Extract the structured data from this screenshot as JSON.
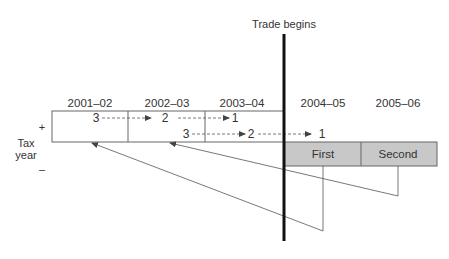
{
  "diagram": {
    "marker_label": "Trade begins",
    "axis_label_line1": "Tax",
    "axis_label_line2": "year",
    "positive_sign": "+",
    "negative_sign": "–",
    "tax_years": [
      "2001–02",
      "2002–03",
      "2003–04",
      "2004–05",
      "2005–06"
    ],
    "loss_boxes": [
      {
        "label": "First",
        "year": "2004–05"
      },
      {
        "label": "Second",
        "year": "2005–06"
      }
    ],
    "carry_back_row1": [
      "3",
      "2",
      "1"
    ],
    "carry_back_row2": [
      "3",
      "2",
      "1"
    ],
    "colors": {
      "loss_fill": "#c8c8c8",
      "line": "#555555",
      "trade_line": "#111111"
    }
  }
}
